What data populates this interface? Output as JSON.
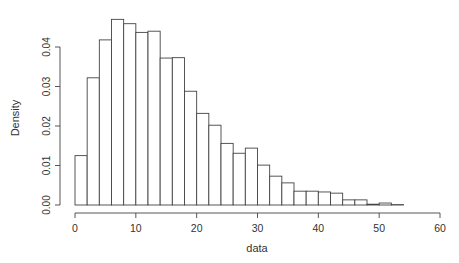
{
  "chart_data": {
    "type": "bar",
    "subtype": "histogram",
    "title": "",
    "xlabel": "data",
    "ylabel": "Density",
    "xlim": [
      0,
      60
    ],
    "ylim": [
      0,
      0.047
    ],
    "x_ticks": [
      0,
      10,
      20,
      30,
      40,
      50,
      60
    ],
    "y_ticks": [
      "0.00",
      "0.01",
      "0.02",
      "0.03",
      "0.04"
    ],
    "bin_width": 2,
    "bins": [
      0,
      2,
      4,
      6,
      8,
      10,
      12,
      14,
      16,
      18,
      20,
      22,
      24,
      26,
      28,
      30,
      32,
      34,
      36,
      38,
      40,
      42,
      44,
      46,
      48,
      50,
      52,
      54,
      56,
      58
    ],
    "values": [
      0.0125,
      0.0322,
      0.0418,
      0.047,
      0.0459,
      0.0437,
      0.044,
      0.0372,
      0.0373,
      0.0288,
      0.0232,
      0.0202,
      0.0156,
      0.0131,
      0.0144,
      0.0101,
      0.0073,
      0.0056,
      0.0035,
      0.0035,
      0.0033,
      0.003,
      0.0013,
      0.0013,
      0.0002,
      0.0005,
      0.0001,
      0,
      0,
      0
    ],
    "grid": false,
    "legend": null
  }
}
